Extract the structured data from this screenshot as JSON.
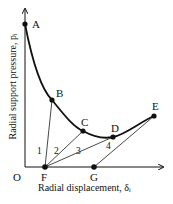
{
  "diagram": {
    "y_axis_label": "Radial support pressure, pᵢ",
    "x_axis_label": "Radial displacement, δᵢ",
    "origin_label": "O",
    "points": [
      {
        "label": "A",
        "x": 25,
        "y": 24
      },
      {
        "label": "B",
        "x": 52,
        "y": 100
      },
      {
        "label": "C",
        "x": 83,
        "y": 131
      },
      {
        "label": "D",
        "x": 113,
        "y": 137
      },
      {
        "label": "E",
        "x": 154,
        "y": 116
      },
      {
        "label": "F",
        "x": 45,
        "y": 167
      },
      {
        "label": "G",
        "x": 94,
        "y": 167
      }
    ],
    "support_lines": [
      {
        "label": "1",
        "from": "F",
        "to": "B"
      },
      {
        "label": "2",
        "from": "F",
        "to": "C"
      },
      {
        "label": "3",
        "from": "F",
        "to": "D"
      },
      {
        "label": "4",
        "from": "G",
        "to": "E"
      }
    ]
  }
}
